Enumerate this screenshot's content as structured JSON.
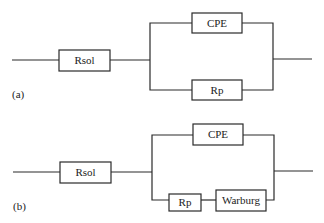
{
  "circuits": [
    {
      "panel_label": "(a)",
      "series": {
        "label": "Rsol"
      },
      "parallel": {
        "top_branch": [
          {
            "label": "CPE"
          }
        ],
        "bottom_branch": [
          {
            "label": "Rp"
          }
        ]
      }
    },
    {
      "panel_label": "(b)",
      "series": {
        "label": "Rsol"
      },
      "parallel": {
        "top_branch": [
          {
            "label": "CPE"
          }
        ],
        "bottom_branch": [
          {
            "label": "Rp"
          },
          {
            "label": "Warburg"
          }
        ]
      }
    }
  ]
}
